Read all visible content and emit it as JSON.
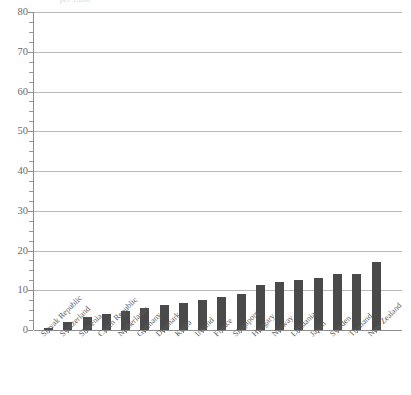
{
  "title_fragment": "per 1,000",
  "axis": {
    "y_label": "",
    "x_label": "",
    "y_ticks": [
      "0",
      "10",
      "20",
      "30",
      "40",
      "50",
      "60",
      "70",
      "80"
    ],
    "y_min": 0,
    "y_max": 80,
    "y_major_step": 10,
    "y_minor_step": 2.5
  },
  "colors": {
    "bar": "#4a4a4a",
    "gridline": "#b9b9b9",
    "axis": "#8e8e8e",
    "tick_label": "#6b6b6b",
    "category_label": "#5d5d5d",
    "background": "#ffffff"
  },
  "chart_data": {
    "type": "bar",
    "title": "",
    "xlabel": "",
    "ylabel": "",
    "ylim": [
      0,
      80
    ],
    "grid": true,
    "legend": "none",
    "orientation": "vertical",
    "sorted": "ascending",
    "categories": [
      "Slovak Republic",
      "Switzerland",
      "Slovenia",
      "Czech Republic",
      "Netherlands",
      "Germany",
      "Denmark",
      "Korea",
      "Ireland",
      "France",
      "Singapore",
      "Hungary",
      "Norway",
      "Lithuania",
      "Japan",
      "Sweden",
      "Thailand",
      "New Zealand"
    ],
    "values": [
      0.5,
      2.0,
      3.2,
      4.0,
      4.8,
      5.6,
      6.4,
      6.8,
      7.6,
      8.4,
      9.0,
      11.2,
      12.0,
      12.6,
      13.2,
      14.0,
      14.2,
      17.0
    ]
  }
}
